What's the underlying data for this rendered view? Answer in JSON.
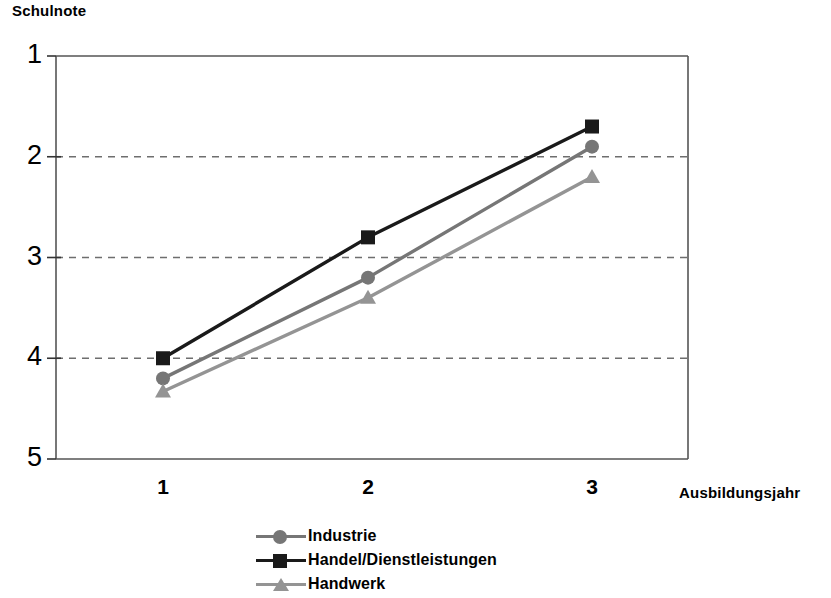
{
  "chart_data": {
    "type": "line",
    "title": "",
    "xlabel": "Ausbildungsjahr",
    "ylabel": "Schulnote",
    "categories": [
      "1",
      "2",
      "3"
    ],
    "x": [
      1,
      2,
      3
    ],
    "xlim": [
      0.5,
      3.5
    ],
    "ylim": [
      1,
      5
    ],
    "y_inverted": true,
    "yticks": [
      "1",
      "2",
      "3",
      "4",
      "5"
    ],
    "ytick_values": [
      1,
      2,
      3,
      4,
      5
    ],
    "xticks": [
      "1",
      "2",
      "3"
    ],
    "grid": "horizontal-dashed",
    "legend_position": "bottom",
    "series": [
      {
        "name": "Industrie",
        "values": [
          4.2,
          3.2,
          1.9
        ],
        "color": "#767676",
        "marker": "circle"
      },
      {
        "name": "Handel/Dienstleistungen",
        "values": [
          4.0,
          2.8,
          1.7
        ],
        "color": "#1a1a1a",
        "marker": "square"
      },
      {
        "name": "Handwerk",
        "values": [
          4.33,
          3.4,
          2.2
        ],
        "color": "#949494",
        "marker": "triangle"
      }
    ]
  },
  "axis": {
    "y_title": "Schulnote",
    "x_title": "Ausbildungsjahr"
  },
  "colors": {
    "axis": "#555555",
    "grid": "#6e6e6e",
    "text": "#000000",
    "industrie": "#767676",
    "handel": "#1a1a1a",
    "handwerk": "#949494"
  }
}
